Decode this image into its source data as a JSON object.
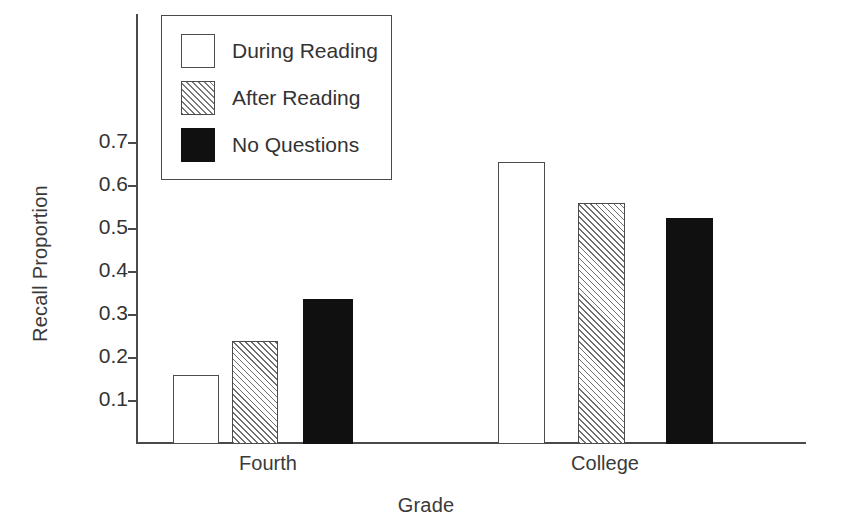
{
  "chart_data": {
    "type": "bar",
    "title": "",
    "xlabel": "Grade",
    "ylabel": "Recall Proportion",
    "categories": [
      "Fourth",
      "College"
    ],
    "series": [
      {
        "name": "During Reading",
        "fill": "open",
        "values": [
          0.16,
          0.655
        ]
      },
      {
        "name": "After Reading",
        "fill": "hatch",
        "values": [
          0.24,
          0.56
        ]
      },
      {
        "name": "No Questions",
        "fill": "solid",
        "values": [
          0.335,
          0.525
        ]
      }
    ],
    "ylim": [
      0,
      0.78
    ],
    "yticks": [
      0.1,
      0.2,
      0.3,
      0.4,
      0.5,
      0.6,
      0.7
    ],
    "ytick_labels": [
      "0.1",
      "0.2",
      "0.3",
      "0.4",
      "0.5",
      "0.6",
      "0.7"
    ],
    "grid": false,
    "legend_position": "upper-left-inside",
    "legend_entries": [
      "During Reading",
      "After Reading",
      "No Questions"
    ],
    "colors": {
      "axis": "#4a4a4a",
      "text": "#333333",
      "open_fill": "#ffffff",
      "hatch_line": "#6e6e6e",
      "solid_fill": "#101010",
      "background": "#ffffff"
    }
  },
  "axis": {
    "y_title": "Recall Proportion",
    "x_title": "Grade",
    "ticks": [
      {
        "label": "0.7",
        "top": 142
      },
      {
        "label": "0.6",
        "top": 185
      },
      {
        "label": "0.5",
        "top": 228
      },
      {
        "label": "0.4",
        "top": 271
      },
      {
        "label": "0.3",
        "top": 314
      },
      {
        "label": "0.2",
        "top": 357
      },
      {
        "label": "0.1",
        "top": 400
      }
    ]
  },
  "groups": [
    {
      "label": "Fourth",
      "label_left": 183,
      "label_width": 170
    },
    {
      "label": "College",
      "label_left": 520,
      "label_width": 170
    }
  ],
  "bars": [
    {
      "name": "bar-fourth-during-reading",
      "fill": "open",
      "left": 173,
      "width": 46,
      "top": 375,
      "height": 69
    },
    {
      "name": "bar-fourth-after-reading",
      "fill": "hatch",
      "left": 232,
      "width": 46,
      "top": 341,
      "height": 103
    },
    {
      "name": "bar-fourth-no-questions",
      "fill": "solid",
      "left": 303,
      "width": 50,
      "top": 299,
      "height": 145
    },
    {
      "name": "bar-college-during-reading",
      "fill": "open",
      "left": 498,
      "width": 47,
      "top": 162,
      "height": 282
    },
    {
      "name": "bar-college-after-reading",
      "fill": "hatch",
      "left": 578,
      "width": 47,
      "top": 203,
      "height": 241
    },
    {
      "name": "bar-college-no-questions",
      "fill": "solid",
      "left": 666,
      "width": 47,
      "top": 218,
      "height": 226
    }
  ],
  "legend": {
    "entries": [
      {
        "fill": "open",
        "label": "During Reading"
      },
      {
        "fill": "hatch",
        "label": "After Reading"
      },
      {
        "fill": "solid",
        "label": "No Questions"
      }
    ]
  }
}
